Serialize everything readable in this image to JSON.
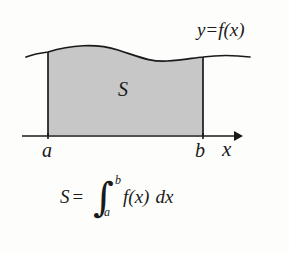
{
  "figure": {
    "background_color": "#fdfefc",
    "stroke_color": "#1a1a1a",
    "shade_color": "#c7c7c7",
    "curve_label": {
      "y": "y",
      "equals": "=",
      "f": "f",
      "open_paren": "(",
      "variable": "x",
      "close_paren": ")",
      "full": "y = f(x)"
    },
    "region_label": "S",
    "axis": {
      "name": "x-axis",
      "label": "x",
      "arrow": "right-arrow",
      "y_pixel": 136,
      "x_start": 22,
      "x_end": 240
    },
    "bounds": {
      "lower_label": "a",
      "upper_label": "b",
      "lower_x_pixel": 48,
      "upper_x_pixel": 203
    },
    "formula": {
      "area_symbol": "S",
      "equals": "=",
      "integral_sign": "∫",
      "limit_lower": "a",
      "limit_upper": "b",
      "integrand_f": "f",
      "integrand_open": "(",
      "integrand_var": "x",
      "integrand_close": ")",
      "differential": "dx",
      "full": "S = ∫ₐᵇ f(x) dx"
    }
  }
}
